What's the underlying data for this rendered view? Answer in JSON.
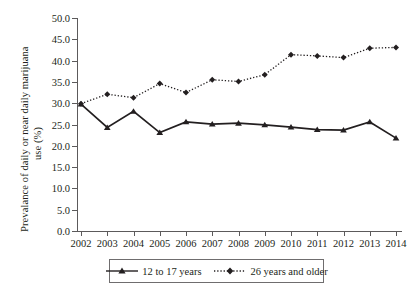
{
  "chart_data": {
    "type": "line",
    "title": "",
    "xlabel": "",
    "ylabel_line1": "Prevalance of daily or near daily marijuana",
    "ylabel_line2": "use (%)",
    "categories": [
      "2002",
      "2003",
      "2004",
      "2005",
      "2006",
      "2007",
      "2008",
      "2009",
      "2010",
      "2011",
      "2012",
      "2013",
      "2014"
    ],
    "x": [
      2002,
      2003,
      2004,
      2005,
      2006,
      2007,
      2008,
      2009,
      2010,
      2011,
      2012,
      2013,
      2014
    ],
    "ylim": [
      0.0,
      50.0
    ],
    "ytick_labels": [
      "0.0",
      "5.0",
      "10.0",
      "15.0",
      "20.0",
      "25.0",
      "30.0",
      "35.0",
      "40.0",
      "45.0",
      "50.0"
    ],
    "ytick_values": [
      0.0,
      5.0,
      10.0,
      15.0,
      20.0,
      25.0,
      30.0,
      35.0,
      40.0,
      45.0,
      50.0
    ],
    "grid": false,
    "legend_position": "bottom-outside",
    "series": [
      {
        "name": "12 to 17 years",
        "marker": "triangle",
        "linestyle": "solid",
        "color": "#231f20",
        "values": [
          29.8,
          24.3,
          28.1,
          23.1,
          25.6,
          25.1,
          25.3,
          24.9,
          24.4,
          23.8,
          23.7,
          25.6,
          21.8
        ]
      },
      {
        "name": "26 years and older",
        "marker": "diamond",
        "linestyle": "dotted",
        "color": "#231f20",
        "values": [
          29.9,
          32.1,
          31.3,
          34.6,
          32.5,
          35.5,
          35.1,
          36.7,
          41.4,
          41.1,
          40.7,
          42.9,
          43.1
        ]
      }
    ]
  },
  "legend": {
    "entries": [
      {
        "label": "12 to 17 years"
      },
      {
        "label": "26 years and older"
      }
    ]
  },
  "colors": {
    "axis": "#5c5a5b",
    "text": "#231f20",
    "series": "#231f20",
    "background": "#ffffff"
  }
}
